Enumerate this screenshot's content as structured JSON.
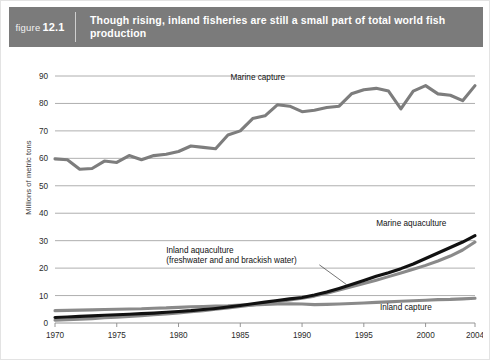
{
  "header": {
    "figure_word": "figure",
    "figure_number": "12.1",
    "title": "Though rising, inland fisheries are still a small part of total world fish production"
  },
  "chart_data": {
    "type": "line",
    "title": "Though rising, inland fisheries are still a small part of total world fish production",
    "xlabel": "",
    "ylabel": "Millions of metric tons",
    "xlim": [
      1970,
      2004
    ],
    "ylim": [
      0,
      90
    ],
    "ytick_step": 10,
    "yticks": [
      "0",
      "10",
      "20",
      "30",
      "40",
      "50",
      "60",
      "70",
      "80",
      "90"
    ],
    "xticks": [
      "1970",
      "1975",
      "1980",
      "1985",
      "1990",
      "1995",
      "2000",
      "2004"
    ],
    "grid": "horizontal",
    "legend": "inline-annotations",
    "x": [
      1970,
      1971,
      1972,
      1973,
      1974,
      1975,
      1976,
      1977,
      1978,
      1979,
      1980,
      1981,
      1982,
      1983,
      1984,
      1985,
      1986,
      1987,
      1988,
      1989,
      1990,
      1991,
      1992,
      1993,
      1994,
      1995,
      1996,
      1997,
      1998,
      1999,
      2000,
      2001,
      2002,
      2003,
      2004
    ],
    "series": [
      {
        "name": "Marine capture",
        "color": "#7d7d7d",
        "label": "Marine capture",
        "values": [
          59.8,
          59.5,
          56.0,
          56.3,
          59.0,
          58.5,
          61.0,
          59.5,
          61.0,
          61.5,
          62.5,
          64.5,
          64.0,
          63.5,
          68.5,
          70.0,
          74.5,
          75.5,
          79.5,
          79.0,
          77.0,
          77.5,
          78.5,
          79.0,
          83.5,
          85.0,
          85.5,
          84.5,
          78.0,
          84.5,
          86.5,
          83.5,
          83.0,
          81.0,
          86.5
        ]
      },
      {
        "name": "Marine aquaculture",
        "color": "#111111",
        "label": "Marine aquaculture",
        "values": [
          2.0,
          2.2,
          2.4,
          2.6,
          2.8,
          3.0,
          3.2,
          3.4,
          3.6,
          3.9,
          4.2,
          4.5,
          4.9,
          5.3,
          5.8,
          6.4,
          7.0,
          7.6,
          8.2,
          8.8,
          9.3,
          10.2,
          11.3,
          12.6,
          14.0,
          15.5,
          17.0,
          18.3,
          19.8,
          21.5,
          23.5,
          25.5,
          27.5,
          29.5,
          31.8
        ]
      },
      {
        "name": "Inland aquaculture",
        "color": "#8a8a8a",
        "label": "Inland aquaculture",
        "sublabel": "(freshwater and and brackish water)",
        "values": [
          1.0,
          1.2,
          1.4,
          1.6,
          1.9,
          2.1,
          2.4,
          2.7,
          3.0,
          3.3,
          3.7,
          4.1,
          4.5,
          5.0,
          5.5,
          6.0,
          6.6,
          7.2,
          7.8,
          8.4,
          9.0,
          9.8,
          10.8,
          12.0,
          13.2,
          14.4,
          15.6,
          16.9,
          18.2,
          19.6,
          21.0,
          22.6,
          24.4,
          26.6,
          29.5
        ]
      },
      {
        "name": "Inland capture",
        "color": "#8a8a8a",
        "label": "Inland capture",
        "values": [
          4.5,
          4.6,
          4.7,
          4.8,
          4.9,
          5.0,
          5.1,
          5.2,
          5.4,
          5.5,
          5.7,
          5.9,
          6.0,
          6.2,
          6.3,
          6.5,
          6.6,
          6.8,
          6.9,
          7.0,
          6.9,
          6.7,
          6.8,
          6.9,
          7.1,
          7.3,
          7.5,
          7.7,
          7.9,
          8.1,
          8.3,
          8.5,
          8.6,
          8.8,
          9.0
        ]
      }
    ]
  }
}
